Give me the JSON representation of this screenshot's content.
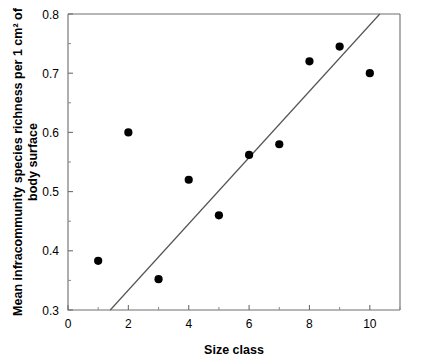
{
  "chart_data": {
    "type": "scatter",
    "title": "",
    "xlabel": "Size class",
    "ylabel": "Mean infracommunity species richness per 1 cm² of body surface",
    "ylabel_line1": "Mean infracommunity species richness per 1 cm² of",
    "ylabel_line2": "body surface",
    "xlim": [
      0,
      11
    ],
    "ylim": [
      0.3,
      0.8
    ],
    "x_ticks": [
      0,
      2,
      4,
      6,
      8,
      10
    ],
    "x_tick_labels": [
      "0",
      "2",
      "4",
      "6",
      "8",
      "10"
    ],
    "x_minor_ticks": [
      1,
      3,
      5,
      7,
      9,
      11
    ],
    "y_ticks": [
      0.3,
      0.4,
      0.5,
      0.6,
      0.7,
      0.8
    ],
    "y_tick_labels": [
      "0.3",
      "0.4",
      "0.5",
      "0.6",
      "0.7",
      "0.8"
    ],
    "grid": false,
    "legend": false,
    "marker": "filled-circle",
    "marker_color": "#000000",
    "x": [
      1,
      2,
      3,
      4,
      5,
      6,
      7,
      8,
      9,
      10
    ],
    "y": [
      0.383,
      0.6,
      0.352,
      0.52,
      0.46,
      0.562,
      0.58,
      0.72,
      0.745,
      0.7
    ],
    "points": [
      {
        "x": 1,
        "y": 0.383
      },
      {
        "x": 2,
        "y": 0.6
      },
      {
        "x": 3,
        "y": 0.352
      },
      {
        "x": 4,
        "y": 0.52
      },
      {
        "x": 5,
        "y": 0.46
      },
      {
        "x": 6,
        "y": 0.562
      },
      {
        "x": 7,
        "y": 0.58
      },
      {
        "x": 8,
        "y": 0.72
      },
      {
        "x": 9,
        "y": 0.745
      },
      {
        "x": 10,
        "y": 0.7
      }
    ],
    "trendline": {
      "type": "linear-fit",
      "x_start": 1.4,
      "y_start": 0.3,
      "x_end": 10.33,
      "y_end": 0.8,
      "color": "#555555"
    },
    "axis_color": "#6e6e6e",
    "background": "#ffffff"
  }
}
